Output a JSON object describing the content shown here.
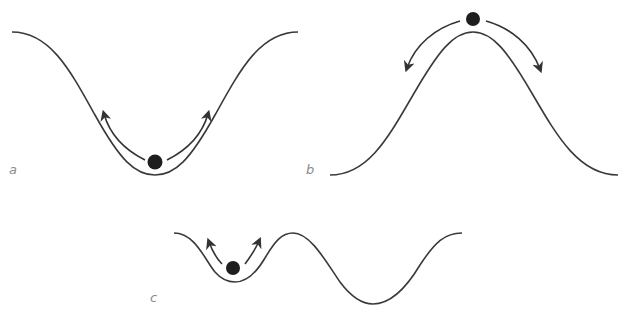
{
  "panels": [
    {
      "id": "a",
      "label": "a",
      "description": "Ball at bottom of valley (stable equilibrium); arrows point up both slopes"
    },
    {
      "id": "b",
      "label": "b",
      "description": "Ball on top of hill (unstable equilibrium); arrows point down both slopes"
    },
    {
      "id": "c",
      "label": "c",
      "description": "Ball in shallow local valley beside deeper valley (metastable equilibrium)"
    }
  ],
  "colors": {
    "curve": "#3a3a3a",
    "ball": "#1e1e1e",
    "arrow": "#333333",
    "label": "#8a8a8a"
  }
}
